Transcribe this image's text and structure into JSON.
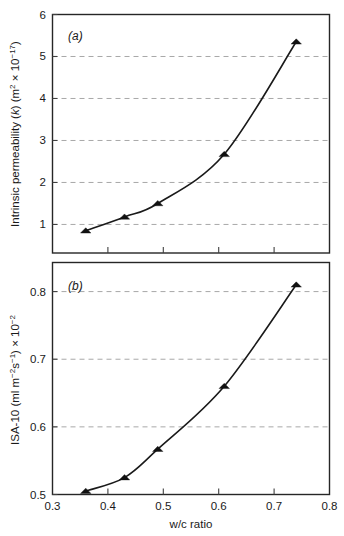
{
  "figure": {
    "background_color": "#ffffff",
    "line_color": "#1a1a1a",
    "grid_color": "#a8a8a8",
    "marker_color": "#111111",
    "x_axis": {
      "label": "w/c ratio",
      "min": 0.3,
      "max": 0.8,
      "ticks": [
        "0.3",
        "0.4",
        "0.5",
        "0.6",
        "0.7",
        "0.8"
      ],
      "tick_values": [
        0.3,
        0.4,
        0.5,
        0.6,
        0.7,
        0.8
      ]
    }
  },
  "panel_a": {
    "tag": "(a)",
    "y_label_parts": {
      "main": "Intrinsic permeability (",
      "italic_k": "k",
      "mid": ") (m",
      "sup1": "2",
      "times": " × 10",
      "sup2": "−17",
      "close": ")"
    },
    "y_label_plain": "Intrinsic permeability (k) (m2 × 10−17)",
    "y_ticks": [
      "1",
      "2",
      "3",
      "4",
      "5",
      "6"
    ],
    "y_tick_values": [
      1,
      2,
      3,
      4,
      5,
      6
    ],
    "y_min": 0.32,
    "y_max": 6.0,
    "gridlines": [
      1,
      2,
      3,
      4,
      5
    ]
  },
  "panel_b": {
    "tag": "(b)",
    "y_label_parts": {
      "main": "ISA-10 (ml m",
      "sup1": "−2",
      "mid": "s",
      "sup2": "−1",
      "close": ") × 10",
      "sup3": "−2"
    },
    "y_label_plain": "ISA-10 (ml m−2s−1) × 10−2",
    "y_ticks": [
      "0.5",
      "0.6",
      "0.7",
      "0.8"
    ],
    "y_tick_values": [
      0.5,
      0.6,
      0.7,
      0.8
    ],
    "y_min": 0.5,
    "y_max": 0.843,
    "gridlines": [
      0.6,
      0.7,
      0.8
    ]
  },
  "chart_data": [
    {
      "type": "line",
      "panel": "(a)",
      "title": "",
      "xlabel": "w/c ratio",
      "ylabel": "Intrinsic permeability (k) (m2 × 10−17)",
      "xlim": [
        0.3,
        0.8
      ],
      "ylim": [
        0.32,
        6.0
      ],
      "xticks": [
        0.3,
        0.4,
        0.5,
        0.6,
        0.7,
        0.8
      ],
      "yticks": [
        1,
        2,
        3,
        4,
        5,
        6
      ],
      "grid": true,
      "grid_axis": "y",
      "legend": "none",
      "marker": "triangle-up",
      "series": [
        {
          "name": "Intrinsic permeability",
          "x": [
            0.36,
            0.43,
            0.49,
            0.61,
            0.74
          ],
          "values": [
            0.85,
            1.18,
            1.5,
            2.67,
            5.35
          ]
        }
      ]
    },
    {
      "type": "line",
      "panel": "(b)",
      "title": "",
      "xlabel": "w/c ratio",
      "ylabel": "ISA-10 (ml m−2s−1) × 10−2",
      "xlim": [
        0.3,
        0.8
      ],
      "ylim": [
        0.5,
        0.843
      ],
      "xticks": [
        0.3,
        0.4,
        0.5,
        0.6,
        0.7,
        0.8
      ],
      "yticks": [
        0.5,
        0.6,
        0.7,
        0.8
      ],
      "grid": true,
      "grid_axis": "y",
      "legend": "none",
      "marker": "triangle-up",
      "series": [
        {
          "name": "ISA-10",
          "x": [
            0.36,
            0.43,
            0.49,
            0.61,
            0.74
          ],
          "values": [
            0.505,
            0.525,
            0.567,
            0.66,
            0.81
          ]
        }
      ]
    }
  ]
}
